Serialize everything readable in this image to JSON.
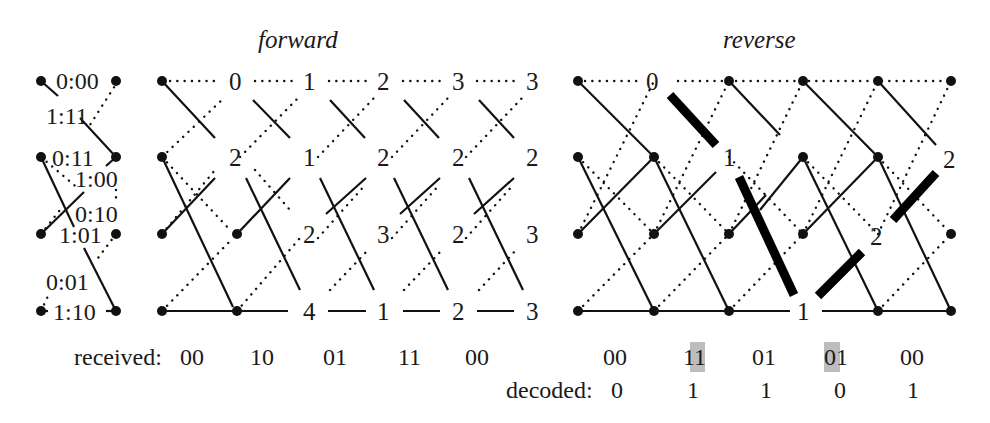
{
  "titles": {
    "forward": "forward",
    "reverse": "reverse"
  },
  "legend": {
    "labels": [
      "0:00",
      "1:11",
      "0:11",
      "1:00",
      "0:10",
      "1:01",
      "0:01",
      "1:10"
    ]
  },
  "forward": {
    "metrics": {
      "row0": [
        "0",
        "1",
        "2",
        "3",
        "3"
      ],
      "row1": [
        "2",
        "1",
        "2",
        "2",
        "2"
      ],
      "row2": [
        "2",
        "3",
        "2",
        "3"
      ],
      "row3": [
        "4",
        "1",
        "2",
        "3"
      ]
    }
  },
  "reverse": {
    "metrics": {
      "row0": [
        "0"
      ],
      "row1": [
        "1",
        "2"
      ],
      "row2": [
        "2"
      ],
      "row3": [
        "1"
      ]
    }
  },
  "received": {
    "label": "received:",
    "forward": [
      "00",
      "10",
      "01",
      "11",
      "00"
    ],
    "reverse": [
      "00",
      "11",
      "01",
      "01",
      "00"
    ],
    "highlighted": [
      "reverse.1.bit1",
      "reverse.3.bit0"
    ]
  },
  "decoded": {
    "label": "decoded:",
    "bits": [
      "0",
      "1",
      "1",
      "0",
      "1"
    ]
  }
}
